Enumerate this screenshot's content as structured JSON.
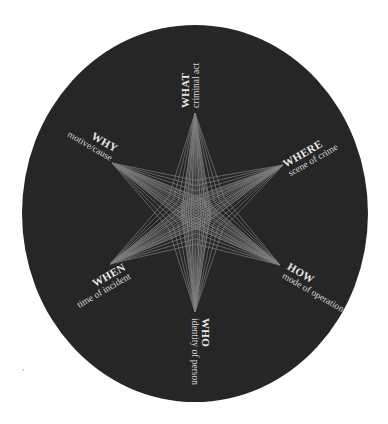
{
  "diagram": {
    "colors": {
      "background": "#ffffff",
      "disc": "#262626",
      "star_lines": "#8a8a8a",
      "text": "#e8e8e8"
    },
    "center": {
      "x": 196,
      "y": 212
    },
    "points": [
      {
        "id": "what",
        "title": "WHAT",
        "subtitle": "criminal act",
        "tip": {
          "x": 195,
          "y": 113
        }
      },
      {
        "id": "where",
        "title": "WHERE",
        "subtitle": "scene of crime",
        "tip": {
          "x": 283,
          "y": 165
        }
      },
      {
        "id": "how",
        "title": "HOW",
        "subtitle": "mode of operation",
        "tip": {
          "x": 280,
          "y": 265
        }
      },
      {
        "id": "who",
        "title": "WHO",
        "subtitle": "identity of person",
        "tip": {
          "x": 195,
          "y": 312
        }
      },
      {
        "id": "when",
        "title": "WHEN",
        "subtitle": "time of incident",
        "tip": {
          "x": 110,
          "y": 264
        }
      },
      {
        "id": "why",
        "title": "WHY",
        "subtitle": "motive/cause",
        "tip": {
          "x": 112,
          "y": 163
        }
      }
    ]
  }
}
